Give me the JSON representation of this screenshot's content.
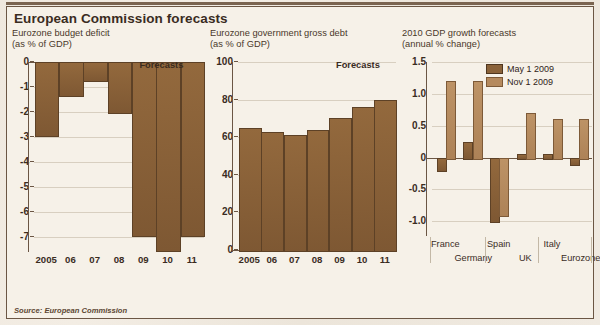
{
  "header": {
    "title": "European Commission forecasts"
  },
  "source": {
    "label": "Source: European Commission"
  },
  "panels": {
    "deficit": {
      "subtitle": "Eurozone budget deficit\n(as % of GDP)",
      "forecast_label": "Forecasts"
    },
    "debt": {
      "subtitle": "Eurozone government gross debt\n(as % of GDP)",
      "forecast_label": "Forecasts"
    },
    "growth": {
      "subtitle": "2010 GDP growth forecasts\n(annual % change)"
    }
  },
  "chart_data": [
    {
      "type": "bar",
      "title": "Eurozone budget deficit",
      "subtitle": "(as % of GDP)",
      "xlabel": "",
      "ylabel": "% of GDP",
      "categories": [
        "2005",
        "06",
        "07",
        "08",
        "09",
        "10",
        "11"
      ],
      "values": [
        -2.9,
        -1.3,
        -0.7,
        -2.0,
        -6.9,
        -7.5,
        -6.9
      ],
      "ylim": [
        -7.5,
        0
      ],
      "yticks": [
        0,
        -1,
        -2,
        -3,
        -4,
        -5,
        -6,
        -7
      ],
      "ytick_labels": [
        "0",
        "-1",
        "-2",
        "-3",
        "-4",
        "-5",
        "-6",
        "-7"
      ],
      "grid": true,
      "annotations": [
        "Forecasts"
      ],
      "forecast_from": "09"
    },
    {
      "type": "bar",
      "title": "Eurozone government gross debt",
      "subtitle": "(as % of GDP)",
      "xlabel": "",
      "ylabel": "% of GDP",
      "categories": [
        "2005",
        "06",
        "07",
        "08",
        "09",
        "10",
        "11"
      ],
      "values": [
        65,
        63,
        61,
        64,
        70,
        76,
        80
      ],
      "ylim": [
        0,
        100
      ],
      "yticks": [
        0,
        20,
        40,
        60,
        80,
        100
      ],
      "ytick_labels": [
        "0",
        "20",
        "40",
        "60",
        "80",
        "100"
      ],
      "grid": true,
      "annotations": [
        "Forecasts"
      ],
      "forecast_from": "09"
    },
    {
      "type": "bar",
      "title": "2010 GDP growth forecasts",
      "subtitle": "(annual % change)",
      "xlabel": "",
      "ylabel": "annual % change",
      "categories": [
        "France",
        "Germany",
        "Spain",
        "UK",
        "Italy",
        "Eurozone"
      ],
      "series": [
        {
          "name": "May 1 2009",
          "values": [
            -0.2,
            0.25,
            -1.0,
            0.05,
            0.05,
            -0.1
          ],
          "color": "#8a6239"
        },
        {
          "name": "Nov 1 2009",
          "values": [
            1.2,
            1.2,
            -0.9,
            0.7,
            0.6,
            0.6
          ],
          "color": "#b58a5e"
        }
      ],
      "ylim": [
        -1.2,
        1.5
      ],
      "yticks": [
        1.5,
        1.0,
        0.5,
        0,
        -0.5,
        -1.0
      ],
      "ytick_labels": [
        "1.5",
        "1.0",
        "0.5",
        "0",
        "-0.5",
        "-1.0"
      ],
      "grid": true,
      "legend": {
        "position": "top-right",
        "entries": [
          "May 1 2009",
          "Nov 1 2009"
        ]
      }
    }
  ]
}
